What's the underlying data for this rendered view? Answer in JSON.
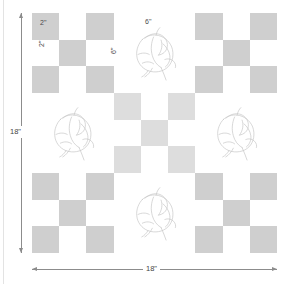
{
  "diagram": {
    "quilt": {
      "total_width_label": "18\"",
      "total_height_label": "18\"",
      "unit_square_label": "2\"",
      "unit_square_label_vertical": "2\"",
      "block_label": "6\"",
      "block_label_vertical": "6\"",
      "grid_rows": 3,
      "grid_cols": 3,
      "checker_rows": 3,
      "checker_cols": 3,
      "colors": {
        "background": "#ffffff",
        "checker_gray": "#cfcfcf",
        "center_checker_gray": "#dddddd",
        "line": "#8c8c8c",
        "drawing": "#c8c8c8",
        "text": "#3f3f3f"
      },
      "blocks": [
        {
          "position": "top-left",
          "type": "checkerboard",
          "shade": "standard"
        },
        {
          "position": "top-center",
          "type": "cotton-boll",
          "shade": "plain"
        },
        {
          "position": "top-right",
          "type": "checkerboard",
          "shade": "standard"
        },
        {
          "position": "middle-left",
          "type": "cotton-boll",
          "shade": "plain"
        },
        {
          "position": "center",
          "type": "checkerboard",
          "shade": "light"
        },
        {
          "position": "middle-right",
          "type": "cotton-boll",
          "shade": "plain"
        },
        {
          "position": "bottom-left",
          "type": "checkerboard",
          "shade": "standard"
        },
        {
          "position": "bottom-center",
          "type": "cotton-boll",
          "shade": "plain"
        },
        {
          "position": "bottom-right",
          "type": "checkerboard",
          "shade": "standard"
        }
      ],
      "checker_pattern": [
        [
          "gray",
          "white",
          "gray"
        ],
        [
          "white",
          "gray",
          "white"
        ],
        [
          "gray",
          "white",
          "gray"
        ]
      ]
    },
    "dimensions": {
      "vertical_label": "18\"",
      "horizontal_label": "18\""
    }
  }
}
